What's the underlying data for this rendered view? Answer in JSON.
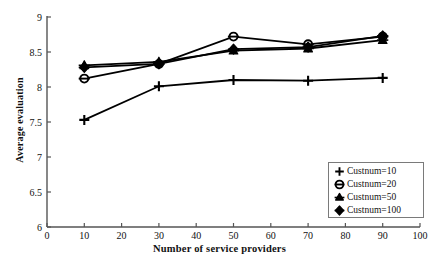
{
  "chart_data": {
    "type": "line",
    "title": "",
    "xlabel": "Number of service providers",
    "ylabel": "Average evaluation",
    "x": [
      10,
      30,
      50,
      70,
      90
    ],
    "xlim": [
      0,
      100
    ],
    "ylim": [
      6,
      9
    ],
    "xticks": [
      0,
      10,
      20,
      30,
      40,
      50,
      60,
      70,
      80,
      90,
      100
    ],
    "yticks": [
      6,
      6.5,
      7,
      7.5,
      8,
      8.5,
      9
    ],
    "xticklabels": [
      "0",
      "10",
      "20",
      "30",
      "40",
      "50",
      "60",
      "70",
      "80",
      "90",
      "100"
    ],
    "yticklabels": [
      "6",
      "6.5",
      "7",
      "7.5",
      "8",
      "8.5",
      "9"
    ],
    "grid": false,
    "legend_position": "lower right",
    "series": [
      {
        "name": "Custnum=10",
        "marker": "plus-icon",
        "color": "#000000",
        "values": [
          7.53,
          8.01,
          8.1,
          8.09,
          8.13
        ]
      },
      {
        "name": "Custnum=20",
        "marker": "circle-bar-icon",
        "color": "#000000",
        "values": [
          8.12,
          8.33,
          8.72,
          8.61,
          8.72
        ]
      },
      {
        "name": "Custnum=50",
        "marker": "triangle-icon",
        "color": "#000000",
        "values": [
          8.31,
          8.36,
          8.52,
          8.55,
          8.67
        ]
      },
      {
        "name": "Custnum=100",
        "marker": "diamond-icon",
        "color": "#000000",
        "values": [
          8.28,
          8.33,
          8.54,
          8.57,
          8.73
        ]
      }
    ]
  },
  "legend": {
    "items": [
      {
        "label": "Custnum=10",
        "marker": "plus-icon"
      },
      {
        "label": "Custnum=20",
        "marker": "circle-bar-icon"
      },
      {
        "label": "Custnum=50",
        "marker": "triangle-icon"
      },
      {
        "label": "Custnum=100",
        "marker": "diamond-icon"
      }
    ]
  }
}
